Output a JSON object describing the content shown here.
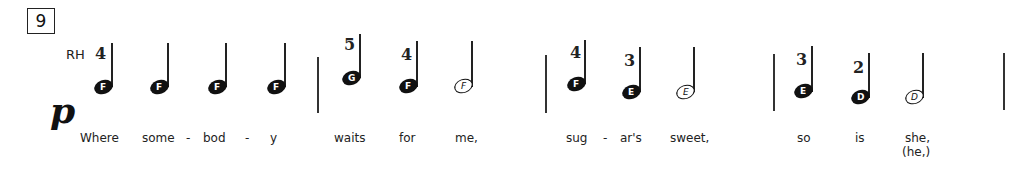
{
  "measure_number": "9",
  "hand": "RH",
  "dynamic": "p",
  "measures": [
    {
      "notes": [
        {
          "name": "F",
          "type": "quarter",
          "filled": true,
          "finger": "4"
        },
        {
          "name": "F",
          "type": "quarter",
          "filled": true,
          "finger": ""
        },
        {
          "name": "F",
          "type": "quarter",
          "filled": true,
          "finger": ""
        },
        {
          "name": "F",
          "type": "quarter",
          "filled": true,
          "finger": ""
        }
      ],
      "lyrics": [
        "Where",
        "some",
        "-",
        "bod",
        "-",
        "y"
      ]
    },
    {
      "notes": [
        {
          "name": "G",
          "type": "quarter",
          "filled": true,
          "finger": "5"
        },
        {
          "name": "F",
          "type": "quarter",
          "filled": true,
          "finger": "4"
        },
        {
          "name": "F",
          "type": "half",
          "filled": false,
          "finger": ""
        }
      ],
      "lyrics": [
        "waits",
        "for",
        "me,"
      ]
    },
    {
      "notes": [
        {
          "name": "F",
          "type": "quarter",
          "filled": true,
          "finger": "4"
        },
        {
          "name": "E",
          "type": "quarter",
          "filled": true,
          "finger": "3"
        },
        {
          "name": "E",
          "type": "half",
          "filled": false,
          "finger": ""
        }
      ],
      "lyrics": [
        "sug",
        "-",
        "ar's",
        "sweet,"
      ]
    },
    {
      "notes": [
        {
          "name": "E",
          "type": "quarter",
          "filled": true,
          "finger": "3"
        },
        {
          "name": "D",
          "type": "quarter",
          "filled": true,
          "finger": "2"
        },
        {
          "name": "D",
          "type": "half",
          "filled": false,
          "finger": ""
        }
      ],
      "lyrics": [
        "so",
        "is",
        "she,"
      ],
      "alt_lyric": "(he,)"
    }
  ]
}
